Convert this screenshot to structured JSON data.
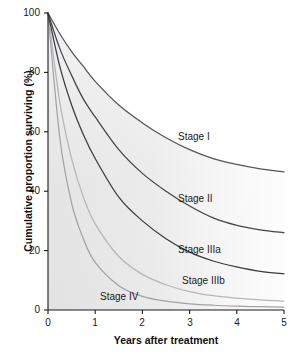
{
  "chart_data": {
    "type": "line",
    "title": "",
    "xlabel": "Years after treatment",
    "ylabel": "Cumulative proportion surviving (%)",
    "xlim": [
      0,
      5
    ],
    "ylim": [
      0,
      100
    ],
    "xticks": [
      "0",
      "1",
      "2",
      "3",
      "4",
      "5"
    ],
    "yticks": [
      "0",
      "20",
      "40",
      "60",
      "80",
      "100"
    ],
    "grid": false,
    "legend_position": "inline-curve-labels",
    "x": [
      0,
      0.25,
      0.5,
      0.75,
      1,
      1.5,
      2,
      2.5,
      3,
      3.5,
      4,
      4.5,
      5
    ],
    "series": [
      {
        "name": "Stage I",
        "label": "Stage I",
        "color": "#55555a",
        "values": [
          100,
          93,
          87,
          82,
          77,
          69,
          63,
          58,
          54,
          51,
          49,
          47.5,
          46.5
        ]
      },
      {
        "name": "Stage II",
        "label": "Stage II",
        "color": "#44444a",
        "values": [
          100,
          88,
          79,
          71,
          65,
          54,
          46,
          40,
          35,
          31,
          28.5,
          27,
          26
        ]
      },
      {
        "name": "Stage IIIa",
        "label": "Stage IIIa",
        "color": "#3a3a40",
        "values": [
          100,
          82,
          69,
          59,
          51,
          38,
          30,
          24,
          19.5,
          16.5,
          14.5,
          13,
          12.2
        ]
      },
      {
        "name": "Stage IIIb",
        "label": "Stage IIIb",
        "color": "#b6b6ba",
        "values": [
          100,
          70,
          51,
          38,
          29,
          18,
          12,
          8.5,
          6.2,
          4.8,
          4,
          3.4,
          3.0
        ]
      },
      {
        "name": "Stage IV",
        "label": "Stage IV",
        "color": "#a2a2a6",
        "values": [
          100,
          58,
          36,
          24,
          16,
          8.2,
          4.6,
          3.0,
          2.1,
          1.6,
          1.3,
          1.1,
          1.0
        ]
      }
    ],
    "annotations": [
      {
        "text": "Stage I",
        "x": 3.0,
        "y": 58
      },
      {
        "text": "Stage II",
        "x": 3.0,
        "y": 37
      },
      {
        "text": "Stage IIIa",
        "x": 3.0,
        "y": 20
      },
      {
        "text": "Stage IIIb",
        "x": 3.1,
        "y": 9.5
      },
      {
        "text": "Stage IV",
        "x": 1.3,
        "y": 4.5
      }
    ],
    "plot_fill_color": "#e4e4e4",
    "axis_color": "#1a1a1a"
  }
}
